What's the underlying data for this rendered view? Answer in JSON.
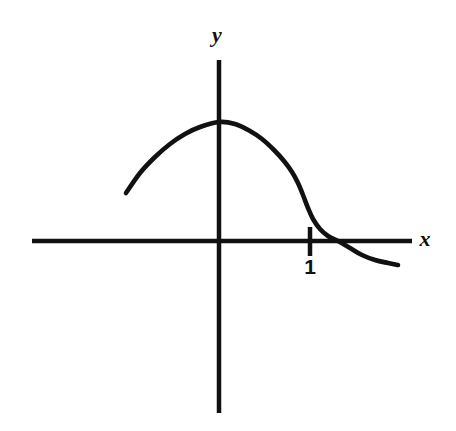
{
  "figure": {
    "background_color": "#ffffff",
    "stroke_color": "#111111",
    "width": 456,
    "height": 431
  },
  "labels": {
    "y_axis": "y",
    "x_axis": "x",
    "tick_one": "1"
  },
  "chart_data": {
    "type": "line",
    "title": "",
    "xlabel": "x",
    "ylabel": "y",
    "grid": false,
    "legend": null,
    "annotations": [
      {
        "text": "1",
        "x": 1,
        "y": 0,
        "role": "x-axis-tick-label"
      },
      {
        "text": "x",
        "role": "x-axis-name"
      },
      {
        "text": "y",
        "role": "y-axis-name"
      }
    ],
    "axes": {
      "x_axis_pixel_y": 241,
      "y_axis_pixel_x": 219,
      "x_axis_pixel_span": [
        32,
        412
      ],
      "y_axis_pixel_span": [
        60,
        413
      ],
      "x_tick_positions": [
        1
      ],
      "x_tick_pixel_positions": [
        310
      ],
      "y_tick_positions": [],
      "origin_pixel": [
        219,
        241
      ]
    },
    "series": [
      {
        "name": "curve",
        "description": "Smooth hump rising from a left endpoint, peaking on the y-axis, then descending steeply through an inflection near x=1 and crossing the x-axis just right of 1, flattening toward a negative horizontal asymptote",
        "pixel_points": [
          [
            126,
            193
          ],
          [
            140,
            173
          ],
          [
            155,
            157
          ],
          [
            170,
            144
          ],
          [
            185,
            134
          ],
          [
            200,
            127
          ],
          [
            219,
            122
          ],
          [
            235,
            124
          ],
          [
            250,
            131
          ],
          [
            262,
            139
          ],
          [
            274,
            150
          ],
          [
            284,
            161
          ],
          [
            292,
            172
          ],
          [
            298,
            183
          ],
          [
            303,
            195
          ],
          [
            308,
            208
          ],
          [
            313,
            219
          ],
          [
            320,
            229
          ],
          [
            328,
            236
          ],
          [
            338,
            241
          ],
          [
            350,
            248
          ],
          [
            362,
            255
          ],
          [
            375,
            260
          ],
          [
            388,
            263
          ],
          [
            398,
            265
          ]
        ],
        "key_features": {
          "left_endpoint": [
            126,
            193
          ],
          "maximum": [
            219,
            122
          ],
          "inflection": [
            303,
            195
          ],
          "x_intercept": [
            340,
            242
          ],
          "right_endpoint": [
            398,
            265
          ]
        }
      }
    ]
  }
}
